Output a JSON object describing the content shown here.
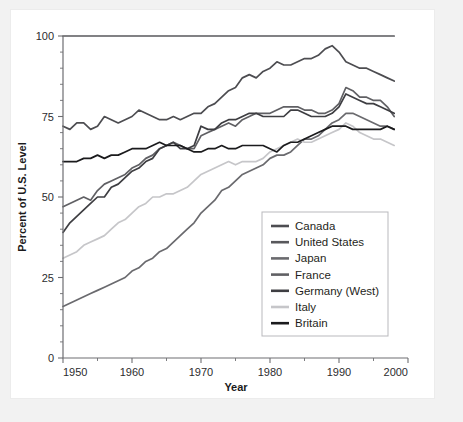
{
  "figure": {
    "background_color": "#f2f2f2",
    "card_color": "#ffffff",
    "axis_color": "#6e6e72"
  },
  "chart_data": {
    "type": "line",
    "title": "",
    "xlabel": "Year",
    "ylabel": "Percent of U.S. Level",
    "xlim": [
      1950,
      2000
    ],
    "ylim": [
      0,
      100
    ],
    "xticks": [
      1950,
      1960,
      1970,
      1980,
      1990,
      2000
    ],
    "xticklabels": [
      "1950",
      "1960",
      "1970",
      "1980",
      "1990",
      "2000"
    ],
    "yticks": [
      0,
      25,
      50,
      75,
      100
    ],
    "yticklabels": [
      "0",
      "25",
      "50",
      "75",
      "100"
    ],
    "x_minor_tick_interval": 5,
    "y_minor_tick_interval": 5,
    "grid": false,
    "legend_position": "lower-right-inside",
    "x": [
      1950,
      1951,
      1952,
      1953,
      1954,
      1955,
      1956,
      1957,
      1958,
      1959,
      1960,
      1961,
      1962,
      1963,
      1964,
      1965,
      1966,
      1967,
      1968,
      1969,
      1970,
      1971,
      1972,
      1973,
      1974,
      1975,
      1976,
      1977,
      1978,
      1979,
      1980,
      1981,
      1982,
      1983,
      1984,
      1985,
      1986,
      1987,
      1988,
      1989,
      1990,
      1991,
      1992,
      1993,
      1994,
      1995,
      1996,
      1997,
      1998
    ],
    "series": [
      {
        "name": "Canada",
        "color": "#4d4d51",
        "values": [
          72,
          71,
          73,
          73,
          71,
          72,
          75,
          74,
          73,
          74,
          75,
          77,
          76,
          75,
          74,
          74,
          75,
          74,
          75,
          76,
          76,
          78,
          79,
          81,
          83,
          84,
          87,
          88,
          87,
          89,
          90,
          92,
          91,
          91,
          92,
          93,
          93,
          94,
          96,
          97,
          95,
          92,
          91,
          90,
          90,
          89,
          88,
          87,
          86
        ]
      },
      {
        "name": "United States",
        "color": "#58585c",
        "values": [
          100,
          100,
          100,
          100,
          100,
          100,
          100,
          100,
          100,
          100,
          100,
          100,
          100,
          100,
          100,
          100,
          100,
          100,
          100,
          100,
          100,
          100,
          100,
          100,
          100,
          100,
          100,
          100,
          100,
          100,
          100,
          100,
          100,
          100,
          100,
          100,
          100,
          100,
          100,
          100,
          100,
          100,
          100,
          100,
          100,
          100,
          100,
          100,
          100
        ]
      },
      {
        "name": "Japan",
        "color": "#6a6a6e",
        "values": [
          16,
          17,
          18,
          19,
          20,
          21,
          22,
          23,
          24,
          25,
          27,
          28,
          30,
          31,
          33,
          34,
          36,
          38,
          40,
          42,
          45,
          47,
          49,
          52,
          53,
          55,
          57,
          58,
          59,
          60,
          62,
          63,
          63,
          64,
          66,
          68,
          68,
          69,
          71,
          73,
          74,
          76,
          76,
          75,
          74,
          73,
          72,
          72,
          71
        ]
      },
      {
        "name": "France",
        "color": "#606064",
        "values": [
          47,
          48,
          49,
          50,
          49,
          52,
          54,
          55,
          56,
          57,
          59,
          60,
          62,
          63,
          65,
          66,
          67,
          66,
          65,
          65,
          69,
          70,
          71,
          72,
          73,
          72,
          74,
          75,
          76,
          76,
          76,
          77,
          78,
          78,
          78,
          77,
          77,
          76,
          76,
          77,
          79,
          84,
          83,
          81,
          81,
          80,
          80,
          78,
          75
        ]
      },
      {
        "name": "Germany (West)",
        "color": "#3e3e42",
        "values": [
          39,
          42,
          44,
          46,
          48,
          50,
          50,
          53,
          54,
          56,
          58,
          59,
          61,
          62,
          65,
          66,
          67,
          65,
          65,
          66,
          72,
          71,
          71,
          73,
          74,
          74,
          75,
          76,
          76,
          75,
          75,
          75,
          75,
          77,
          77,
          76,
          75,
          75,
          75,
          76,
          78,
          82,
          81,
          80,
          79,
          79,
          78,
          77,
          76
        ]
      },
      {
        "name": "Italy",
        "color": "#c6c6c9",
        "values": [
          31,
          32,
          33,
          35,
          36,
          37,
          38,
          40,
          42,
          43,
          45,
          47,
          48,
          50,
          50,
          51,
          51,
          52,
          53,
          55,
          57,
          58,
          59,
          60,
          61,
          60,
          61,
          61,
          61,
          62,
          64,
          65,
          66,
          67,
          68,
          67,
          67,
          68,
          69,
          70,
          71,
          73,
          72,
          70,
          69,
          68,
          68,
          67,
          66
        ]
      },
      {
        "name": "Britain",
        "color": "#1b1b1d",
        "values": [
          61,
          61,
          61,
          62,
          62,
          63,
          62,
          63,
          63,
          64,
          65,
          65,
          65,
          66,
          67,
          66,
          66,
          66,
          65,
          64,
          64,
          65,
          65,
          66,
          65,
          65,
          66,
          66,
          66,
          66,
          65,
          64,
          66,
          67,
          67,
          68,
          69,
          70,
          71,
          72,
          72,
          72,
          71,
          71,
          71,
          71,
          71,
          72,
          71
        ]
      }
    ]
  }
}
